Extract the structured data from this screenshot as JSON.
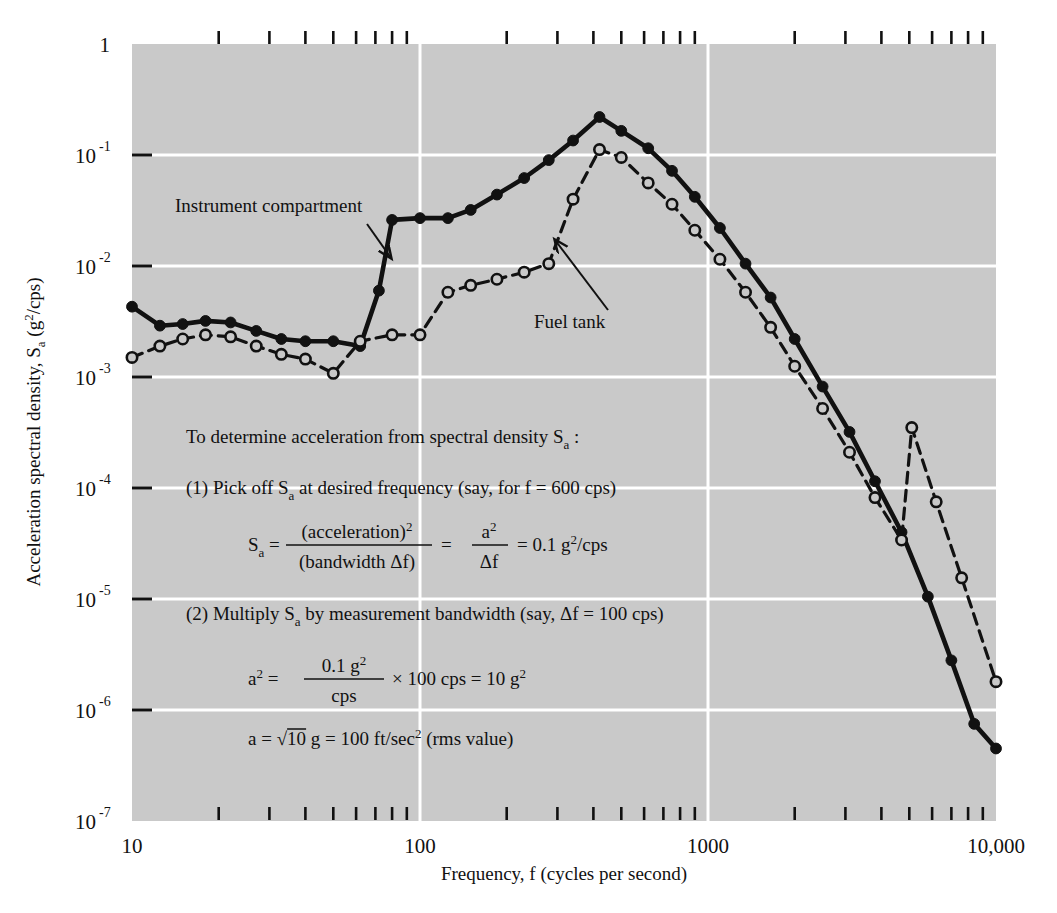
{
  "chart_data": {
    "type": "line",
    "title": "",
    "xlabel": "Frequency, f  (cycles per second)",
    "ylabel": "Acceleration spectral density, S_a  (g^2/cps)",
    "ylabel_parts": {
      "main": "Acceleration spectral density, S",
      "sub": "a",
      "unit_open": "  (g",
      "unit_sup": "2",
      "unit_close": "/cps)"
    },
    "xscale": "log",
    "yscale": "log",
    "xlim": [
      10,
      10000
    ],
    "ylim": [
      1e-07,
      1
    ],
    "grid": true,
    "grid_color": "#ffffff",
    "plot_bg": "#c9c9c9",
    "xticks": [
      10,
      100,
      1000,
      10000
    ],
    "xtick_labels": [
      "10",
      "100",
      "1000",
      "10,000"
    ],
    "yticks": [
      1,
      0.1,
      0.01,
      0.001,
      0.0001,
      1e-05,
      1e-06,
      1e-07
    ],
    "ytick_labels": [
      "1",
      "10",
      "10",
      "10",
      "10",
      "10",
      "10",
      "10"
    ],
    "ytick_exponents": [
      "",
      "-1",
      "-2",
      "-3",
      "-4",
      "-5",
      "-6",
      "-7"
    ],
    "legend_position": "inline-annotations",
    "series": [
      {
        "name": "Instrument compartment",
        "style": "solid",
        "marker": "filled-circle",
        "color": "#111111",
        "points": [
          [
            10,
            0.0043
          ],
          [
            12.5,
            0.0029
          ],
          [
            15,
            0.003
          ],
          [
            18,
            0.0032
          ],
          [
            22,
            0.0031
          ],
          [
            27,
            0.0026
          ],
          [
            33,
            0.0022
          ],
          [
            40,
            0.0021
          ],
          [
            50,
            0.0021
          ],
          [
            62,
            0.0019
          ],
          [
            72,
            0.006
          ],
          [
            80,
            0.026
          ],
          [
            100,
            0.027
          ],
          [
            125,
            0.027
          ],
          [
            150,
            0.032
          ],
          [
            185,
            0.044
          ],
          [
            230,
            0.062
          ],
          [
            280,
            0.09
          ],
          [
            340,
            0.135
          ],
          [
            420,
            0.22
          ],
          [
            500,
            0.165
          ],
          [
            620,
            0.115
          ],
          [
            750,
            0.072
          ],
          [
            900,
            0.042
          ],
          [
            1100,
            0.022
          ],
          [
            1350,
            0.0105
          ],
          [
            1650,
            0.0052
          ],
          [
            2000,
            0.0022
          ],
          [
            2500,
            0.00082
          ],
          [
            3100,
            0.00032
          ],
          [
            3800,
            0.000115
          ],
          [
            4700,
            4e-05
          ],
          [
            5800,
            1.05e-05
          ],
          [
            7000,
            2.8e-06
          ],
          [
            8400,
            7.5e-07
          ],
          [
            10000,
            4.5e-07
          ]
        ]
      },
      {
        "name": "Fuel tank",
        "style": "dashed",
        "marker": "open-circle",
        "color": "#111111",
        "points": [
          [
            10,
            0.0015
          ],
          [
            12.5,
            0.0019
          ],
          [
            15,
            0.0022
          ],
          [
            18,
            0.0024
          ],
          [
            22,
            0.0023
          ],
          [
            27,
            0.0019
          ],
          [
            33,
            0.0016
          ],
          [
            40,
            0.00145
          ],
          [
            50,
            0.00108
          ],
          [
            62,
            0.0021
          ],
          [
            80,
            0.0024
          ],
          [
            100,
            0.0024
          ],
          [
            125,
            0.0058
          ],
          [
            150,
            0.0067
          ],
          [
            185,
            0.0076
          ],
          [
            230,
            0.0088
          ],
          [
            280,
            0.0105
          ],
          [
            340,
            0.04
          ],
          [
            420,
            0.112
          ],
          [
            500,
            0.095
          ],
          [
            620,
            0.056
          ],
          [
            750,
            0.036
          ],
          [
            900,
            0.021
          ],
          [
            1100,
            0.0115
          ],
          [
            1350,
            0.0058
          ],
          [
            1650,
            0.0028
          ],
          [
            2000,
            0.00125
          ],
          [
            2500,
            0.00052
          ],
          [
            3100,
            0.00021
          ],
          [
            3800,
            8.2e-05
          ],
          [
            4700,
            3.4e-05
          ],
          [
            5100,
            0.00035
          ],
          [
            6200,
            7.5e-05
          ],
          [
            7600,
            1.55e-05
          ],
          [
            10000,
            1.8e-06
          ]
        ]
      }
    ],
    "annotations": [
      {
        "text": "Instrument compartment",
        "text_x": 175,
        "text_y": 212,
        "arrow_from_x": 367,
        "arrow_from_y": 224,
        "arrow_to_x": 391,
        "arrow_to_y": 258
      },
      {
        "text": "Fuel tank",
        "text_x": 534,
        "text_y": 328,
        "arrow_from_x": 608,
        "arrow_from_y": 310,
        "arrow_to_x": 555,
        "arrow_to_y": 240
      }
    ],
    "notes": {
      "heading": "To determine acceleration from spectral density S",
      "heading_sub": "a",
      "heading_tail": " :",
      "step1_pre": "(1) Pick off S",
      "step1_sub": "a",
      "step1_post": " at desired frequency (say, for f = 600 cps)",
      "formula1": {
        "lhs": "S",
        "lhs_sub": "a",
        "eq1": " = ",
        "frac1_num": "(acceleration)",
        "frac1_num_sup": "2",
        "frac1_den": "(bandwidth Δf)",
        "eq2": " = ",
        "frac2_num": "a",
        "frac2_num_sup": "2",
        "frac2_den": "Δf",
        "eq3": " = 0.1 g",
        "tail_sup": "2",
        "tail": "/cps"
      },
      "step2_pre": "(2) Multiply S",
      "step2_sub": "a",
      "step2_post": " by measurement bandwidth (say, Δf = 100 cps)",
      "formula2": {
        "lhs": "a",
        "lhs_sup": "2",
        "eq1": " = ",
        "frac_num": "0.1 g",
        "frac_num_sup": "2",
        "frac_den": "cps",
        "mid": " × 100 cps = 10 g",
        "tail_sup": "2"
      },
      "formula3": {
        "lhs": "a  =  ",
        "sqrt": "√",
        "radicand": "10",
        "mid": " g = 100 ft/sec",
        "sup": "2",
        "tail": " (rms value)"
      }
    }
  }
}
